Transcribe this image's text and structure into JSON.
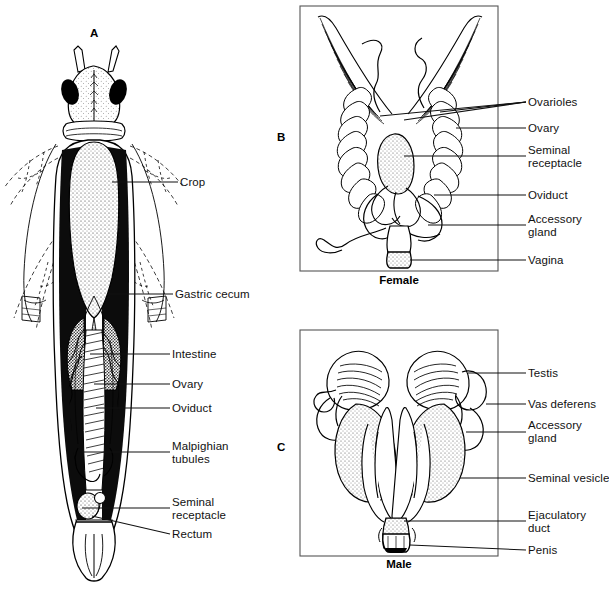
{
  "figure": {
    "background_color": "#ffffff",
    "ink_color": "#111111",
    "width": 607,
    "height": 589
  },
  "panels": [
    {
      "id": "A",
      "letter": "A",
      "name": "whole-body-dorsal-dissection",
      "caption": "",
      "letter_x": 94,
      "letter_y": 33,
      "labels": [
        {
          "text": "Crop",
          "x": 180,
          "y": 176,
          "lx1": 112,
          "ly1": 182,
          "lx2": 178,
          "ly2": 182
        },
        {
          "text": "Gastric cecum",
          "x": 175,
          "y": 288,
          "lx1": 108,
          "ly1": 294,
          "lx2": 173,
          "ly2": 294
        },
        {
          "text": "Intestine",
          "x": 172,
          "y": 348,
          "lx1": 90,
          "ly1": 354,
          "lx2": 170,
          "ly2": 354
        },
        {
          "text": "Ovary",
          "x": 172,
          "y": 378,
          "lx1": 94,
          "ly1": 384,
          "lx2": 170,
          "ly2": 384
        },
        {
          "text": "Oviduct",
          "x": 172,
          "y": 402,
          "lx1": 96,
          "ly1": 408,
          "lx2": 170,
          "ly2": 408
        },
        {
          "text": "Malpighian",
          "x": 172,
          "y": 440,
          "lx1": 82,
          "ly1": 452,
          "lx2": 170,
          "ly2": 452
        },
        {
          "text": "tubules",
          "x": 172,
          "y": 453,
          "lx1": 0,
          "ly1": 0,
          "lx2": 0,
          "ly2": 0
        },
        {
          "text": "Seminal",
          "x": 172,
          "y": 496,
          "lx1": 82,
          "ly1": 508,
          "lx2": 170,
          "ly2": 508
        },
        {
          "text": "receptacle",
          "x": 172,
          "y": 509,
          "lx1": 0,
          "ly1": 0,
          "lx2": 0,
          "ly2": 0
        },
        {
          "text": "Rectum",
          "x": 172,
          "y": 528,
          "lx1": 92,
          "ly1": 516,
          "lx2": 170,
          "ly2": 534
        }
      ]
    },
    {
      "id": "B",
      "letter": "B",
      "name": "female-reproductive-system",
      "caption": "Female",
      "letter_x": 280,
      "letter_y": 132,
      "frame": {
        "x": 300,
        "y": 6,
        "w": 198,
        "h": 265
      },
      "caption_x": 399,
      "caption_y": 279,
      "labels": [
        {
          "text": "Ovarioles",
          "x": 528,
          "y": 97,
          "lx1": 516,
          "ly1": 102,
          "lx2": 526,
          "ly2": 102
        },
        {
          "text": "Ovary",
          "x": 528,
          "y": 123,
          "lx1": 500,
          "ly1": 128,
          "lx2": 526,
          "ly2": 128
        },
        {
          "text": "Seminal",
          "x": 528,
          "y": 145,
          "lx1": 500,
          "ly1": 156,
          "lx2": 526,
          "ly2": 156
        },
        {
          "text": "receptacle",
          "x": 528,
          "y": 158,
          "lx1": 0,
          "ly1": 0,
          "lx2": 0,
          "ly2": 0
        },
        {
          "text": "Oviduct",
          "x": 528,
          "y": 190,
          "lx1": 500,
          "ly1": 195,
          "lx2": 526,
          "ly2": 195
        },
        {
          "text": "Accessory",
          "x": 528,
          "y": 214,
          "lx1": 500,
          "ly1": 225,
          "lx2": 526,
          "ly2": 225
        },
        {
          "text": "gland",
          "x": 528,
          "y": 227,
          "lx1": 0,
          "ly1": 0,
          "lx2": 0,
          "ly2": 0
        },
        {
          "text": "Vagina",
          "x": 528,
          "y": 255,
          "lx1": 500,
          "ly1": 260,
          "lx2": 526,
          "ly2": 260
        }
      ]
    },
    {
      "id": "C",
      "letter": "C",
      "name": "male-reproductive-system",
      "caption": "Male",
      "letter_x": 280,
      "letter_y": 442,
      "frame": {
        "x": 300,
        "y": 330,
        "w": 198,
        "h": 226
      },
      "caption_x": 399,
      "caption_y": 563,
      "labels": [
        {
          "text": "Testis",
          "x": 528,
          "y": 368,
          "lx1": 500,
          "ly1": 373,
          "lx2": 526,
          "ly2": 373
        },
        {
          "text": "Vas deferens",
          "x": 528,
          "y": 399,
          "lx1": 500,
          "ly1": 404,
          "lx2": 526,
          "ly2": 404
        },
        {
          "text": "Accessory",
          "x": 528,
          "y": 420,
          "lx1": 500,
          "ly1": 432,
          "lx2": 526,
          "ly2": 432
        },
        {
          "text": "gland",
          "x": 528,
          "y": 433,
          "lx1": 0,
          "ly1": 0,
          "lx2": 0,
          "ly2": 0
        },
        {
          "text": "Seminal vesicle",
          "x": 528,
          "y": 473,
          "lx1": 500,
          "ly1": 478,
          "lx2": 526,
          "ly2": 478
        },
        {
          "text": "Ejaculatory",
          "x": 528,
          "y": 510,
          "lx1": 500,
          "ly1": 521,
          "lx2": 526,
          "ly2": 521
        },
        {
          "text": "duct",
          "x": 528,
          "y": 523,
          "lx1": 0,
          "ly1": 0,
          "lx2": 0,
          "ly2": 0
        },
        {
          "text": "Penis",
          "x": 528,
          "y": 545,
          "lx1": 500,
          "ly1": 550,
          "lx2": 526,
          "ly2": 550
        }
      ]
    }
  ]
}
